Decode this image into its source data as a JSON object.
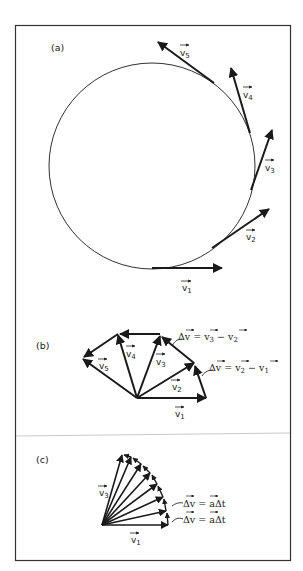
{
  "figure": {
    "panels": [
      {
        "id": "a",
        "label": "(a)",
        "vectors": [
          {
            "name": "v1",
            "label": "v",
            "sub": "1"
          },
          {
            "name": "v2",
            "label": "v",
            "sub": "2"
          },
          {
            "name": "v3",
            "label": "v",
            "sub": "3"
          },
          {
            "name": "v4",
            "label": "v",
            "sub": "4"
          },
          {
            "name": "v5",
            "label": "v",
            "sub": "5"
          }
        ]
      },
      {
        "id": "b",
        "label": "(b)",
        "vectors": [
          {
            "name": "v1",
            "label": "v",
            "sub": "1"
          },
          {
            "name": "v2",
            "label": "v",
            "sub": "2"
          },
          {
            "name": "v3",
            "label": "v",
            "sub": "3"
          },
          {
            "name": "v4",
            "label": "v",
            "sub": "4"
          },
          {
            "name": "v5",
            "label": "v",
            "sub": "5"
          }
        ],
        "equations": [
          {
            "lhs": "Δv",
            "eq": " = ",
            "a": "v",
            "a_sub": "3",
            "minus": " − ",
            "b": "v",
            "b_sub": "2"
          },
          {
            "lhs": "Δv",
            "eq": " = ",
            "a": "v",
            "a_sub": "2",
            "minus": " − ",
            "b": "v",
            "b_sub": "1"
          }
        ]
      },
      {
        "id": "c",
        "label": "(c)",
        "vectors": [
          {
            "name": "v1",
            "label": "v",
            "sub": "1"
          },
          {
            "name": "v3",
            "label": "v",
            "sub": "3"
          }
        ],
        "equations": [
          {
            "lhs": "Δv",
            "eq": " = ",
            "rhs": "aΔt"
          },
          {
            "lhs": "Δv",
            "eq": " = ",
            "rhs": "aΔt"
          }
        ]
      }
    ],
    "colors": {
      "ink": "#1a1a1a",
      "frame": "#333333",
      "divider": "#bbbbbb",
      "background": "#ffffff"
    }
  }
}
